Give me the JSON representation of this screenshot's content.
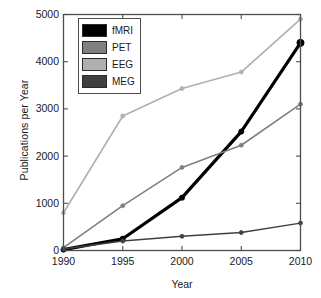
{
  "chart_data": {
    "type": "line",
    "title": "",
    "xlabel": "Year",
    "ylabel": "Publications per Year",
    "x": [
      1990,
      1995,
      2000,
      2005,
      2010
    ],
    "categories": [
      "1990",
      "1995",
      "2000",
      "2005",
      "2010"
    ],
    "xtick_labels": [
      "1990",
      "1995",
      "2000",
      "2005",
      "2010"
    ],
    "ytick_labels": [
      "0",
      "1000",
      "2000",
      "3000",
      "4000",
      "5000"
    ],
    "ytick_values": [
      0,
      1000,
      2000,
      3000,
      4000,
      5000
    ],
    "xlim": [
      1990,
      2010
    ],
    "ylim": [
      0,
      5000
    ],
    "grid": false,
    "legend_position": "upper left inside",
    "series": [
      {
        "name": "fMRI",
        "color": "#000000",
        "line_width": 3.2,
        "marker": "circle",
        "values": [
          20,
          250,
          1120,
          2520,
          4400
        ]
      },
      {
        "name": "PET",
        "color": "#808080",
        "line_width": 1.6,
        "marker": "circle",
        "values": [
          60,
          950,
          1760,
          2230,
          3100
        ]
      },
      {
        "name": "EEG",
        "color": "#b0b0b0",
        "line_width": 1.6,
        "marker": "circle",
        "values": [
          800,
          2850,
          3430,
          3780,
          4900
        ]
      },
      {
        "name": "MEG",
        "color": "#404040",
        "line_width": 1.5,
        "marker": "circle",
        "values": [
          30,
          200,
          300,
          380,
          580
        ]
      }
    ]
  },
  "legend": {
    "entries": [
      {
        "label": "fMRI",
        "color": "#000000"
      },
      {
        "label": "PET",
        "color": "#808080"
      },
      {
        "label": "EEG",
        "color": "#b0b0b0"
      },
      {
        "label": "MEG",
        "color": "#404040"
      }
    ]
  },
  "axes": {
    "box_color": "#4d4d4d",
    "background": "#ffffff"
  }
}
